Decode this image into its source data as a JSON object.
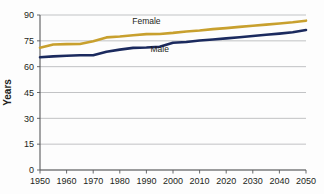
{
  "chart_data": {
    "type": "line",
    "title": "",
    "xlabel": "",
    "ylabel": "Years",
    "xlim": [
      1950,
      2050
    ],
    "ylim": [
      0,
      90
    ],
    "yticks": [
      0,
      15,
      30,
      45,
      60,
      75,
      90
    ],
    "xticks": [
      1950,
      1960,
      1970,
      1980,
      1990,
      2000,
      2010,
      2020,
      2030,
      2040,
      2050
    ],
    "grid": true,
    "legend_position": "inline-annotations",
    "x": [
      1950,
      1955,
      1960,
      1965,
      1970,
      1975,
      1980,
      1985,
      1990,
      1995,
      2000,
      2005,
      2010,
      2015,
      2020,
      2025,
      2030,
      2035,
      2040,
      2045,
      2050
    ],
    "series": [
      {
        "name": "Female",
        "color": "#c8a02e",
        "label_x": 1990,
        "label_y": 84.5,
        "values": [
          71.0,
          72.9,
          73.1,
          73.2,
          74.8,
          77.0,
          77.5,
          78.2,
          78.9,
          79.0,
          79.6,
          80.4,
          81.0,
          81.8,
          82.4,
          83.1,
          83.8,
          84.4,
          85.1,
          85.8,
          86.7
        ]
      },
      {
        "name": "Male",
        "color": "#1b2a5e",
        "label_x": 1995,
        "label_y": 68.5,
        "values": [
          65.5,
          66.0,
          66.3,
          66.6,
          66.6,
          68.7,
          69.9,
          70.9,
          71.1,
          71.6,
          73.9,
          74.3,
          75.2,
          75.8,
          76.4,
          77.1,
          77.8,
          78.5,
          79.2,
          80.0,
          81.3
        ]
      }
    ]
  }
}
